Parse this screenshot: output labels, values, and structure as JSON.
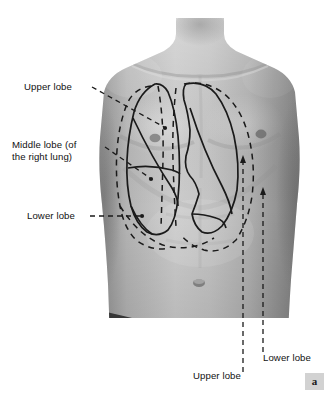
{
  "figure": {
    "panel_marker": "a",
    "colors": {
      "line": "#1a1a1a",
      "text": "#111111",
      "badge_background": "#d2d2d2",
      "page_background": "#ffffff",
      "skin_light": "#cfcfcf",
      "skin_mid": "#a8a8a8",
      "skin_dark": "#7d7d7d"
    }
  },
  "labels": [
    {
      "id": "upper-lobe-right",
      "text": "Upper lobe",
      "side": "left",
      "x": 24,
      "y": 81,
      "leader": "dashed-line-to-dot",
      "target": "right lung upper lobe"
    },
    {
      "id": "middle-lobe-right",
      "text": "Middle lobe (of\nthe right lung)",
      "side": "left",
      "x": 12,
      "y": 139,
      "leader": "dashed-line-to-dot",
      "target": "right lung middle lobe"
    },
    {
      "id": "lower-lobe-right",
      "text": "Lower lobe",
      "side": "left",
      "x": 27,
      "y": 210,
      "leader": "dashed-line-to-dot",
      "target": "right lung lower lobe"
    },
    {
      "id": "upper-lobe-left",
      "text": "Upper lobe",
      "side": "bottom",
      "x": 193,
      "y": 370,
      "leader": "dashed-vertical-arrow",
      "target": "left lung upper lobe"
    },
    {
      "id": "lower-lobe-left",
      "text": "Lower lobe",
      "side": "bottom",
      "x": 263,
      "y": 352,
      "leader": "dashed-vertical-arrow",
      "target": "left lung lower lobe"
    }
  ],
  "anatomy": {
    "structures": [
      "right lung surface projection",
      "left lung surface projection",
      "horizontal fissure",
      "oblique fissure (right)",
      "oblique fissure (left)",
      "cardiac notch",
      "parietal pleural reflection"
    ],
    "line_styles": {
      "lung_border": "solid",
      "pleural_reflection": "dashed",
      "leader": "dashed"
    }
  }
}
